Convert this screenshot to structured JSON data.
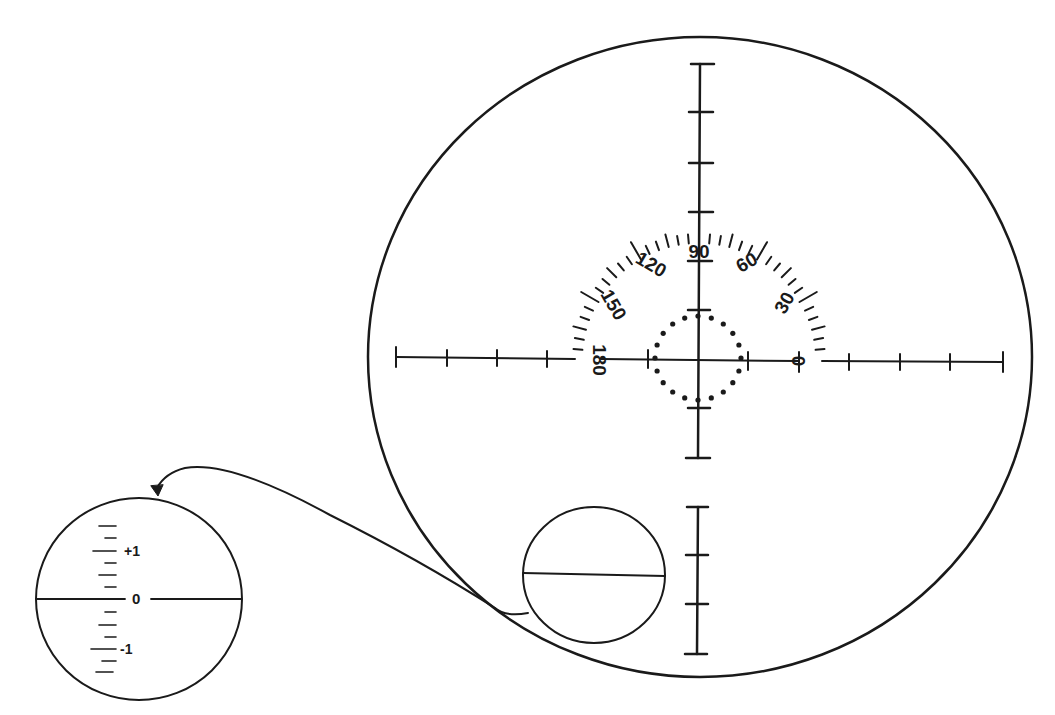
{
  "diagram": {
    "colors": {
      "ink": "#1a1a1a",
      "background": "#ffffff"
    },
    "main_reticle": {
      "protractor_labels": [
        "0",
        "30",
        "60",
        "90",
        "120",
        "150",
        "180"
      ],
      "crosshair": "horizontal and vertical ticked axes",
      "dotted_diamond": "center aiming circle of dots"
    },
    "level_bubble": {
      "description": "small circle with horizontal line"
    },
    "inset_scale": {
      "labels": {
        "plus": "+1",
        "zero": "0",
        "minus": "-1"
      }
    }
  }
}
